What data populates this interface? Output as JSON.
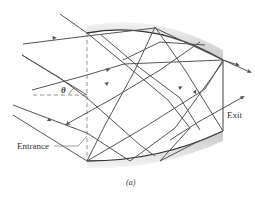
{
  "figure": {
    "caption": "(a)",
    "labels": {
      "entrance": "Entrance",
      "exit": "Exit",
      "angle": "θ"
    },
    "colors": {
      "ray": "#555555",
      "wall_shade": "#d8d8d8",
      "wall_edge": "#333333",
      "dashed": "#777777",
      "text": "#333333"
    }
  }
}
